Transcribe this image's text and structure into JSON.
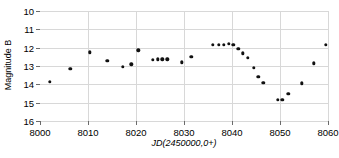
{
  "chart_data": {
    "type": "scatter",
    "title": "",
    "xlabel": "JD(2450000,0+)",
    "ylabel": "Magnitude B",
    "xlim": [
      8000,
      8060
    ],
    "ylim": [
      16,
      10
    ],
    "y_inverted": true,
    "grid": true,
    "legend": null,
    "xticks": [
      8000,
      8010,
      8020,
      8030,
      8040,
      8050,
      8060
    ],
    "xtick_labels": [
      "8000",
      "8010",
      "8020",
      "8030",
      "8040",
      "8050",
      "8060"
    ],
    "yticks": [
      10,
      11,
      12,
      13,
      14,
      15,
      16
    ],
    "ytick_labels": [
      "10",
      "11",
      "12",
      "13",
      "14",
      "15",
      "16"
    ],
    "marker": "filled-circle",
    "marker_color": "#111111",
    "points": [
      {
        "x": 8002.0,
        "y": 13.85
      },
      {
        "x": 8006.3,
        "y": 13.15
      },
      {
        "x": 8010.4,
        "y": 12.25
      },
      {
        "x": 8014.0,
        "y": 12.7
      },
      {
        "x": 8017.3,
        "y": 13.05
      },
      {
        "x": 8019.0,
        "y": 12.9
      },
      {
        "x": 8020.5,
        "y": 12.15
      },
      {
        "x": 8023.5,
        "y": 12.65
      },
      {
        "x": 8024.5,
        "y": 12.63
      },
      {
        "x": 8025.5,
        "y": 12.63
      },
      {
        "x": 8026.5,
        "y": 12.63
      },
      {
        "x": 8029.5,
        "y": 12.8
      },
      {
        "x": 8031.5,
        "y": 12.5
      },
      {
        "x": 8036.0,
        "y": 11.85
      },
      {
        "x": 8037.3,
        "y": 11.85
      },
      {
        "x": 8038.3,
        "y": 11.83
      },
      {
        "x": 8039.3,
        "y": 11.8
      },
      {
        "x": 8040.3,
        "y": 11.85
      },
      {
        "x": 8041.3,
        "y": 12.05
      },
      {
        "x": 8042.3,
        "y": 12.3
      },
      {
        "x": 8043.3,
        "y": 12.55
      },
      {
        "x": 8044.5,
        "y": 13.1
      },
      {
        "x": 8045.5,
        "y": 13.6
      },
      {
        "x": 8046.5,
        "y": 13.9
      },
      {
        "x": 8049.5,
        "y": 14.85
      },
      {
        "x": 8050.5,
        "y": 14.85
      },
      {
        "x": 8051.7,
        "y": 14.5
      },
      {
        "x": 8054.5,
        "y": 13.95
      },
      {
        "x": 8057.0,
        "y": 12.85
      },
      {
        "x": 8059.5,
        "y": 11.85
      }
    ]
  }
}
